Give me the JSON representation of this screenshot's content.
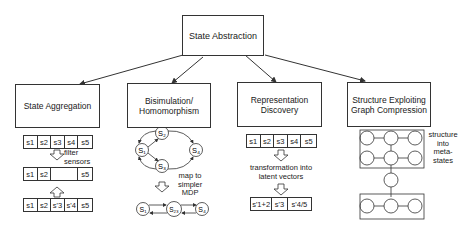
{
  "root": {
    "label": "State Abstraction"
  },
  "categories": [
    {
      "label": "State Aggregation"
    },
    {
      "label": "Bisimulation/\nHomomorphism"
    },
    {
      "label": "Representation\nDiscovery"
    },
    {
      "label": "Structure Exploiting\nGraph Compression"
    }
  ],
  "aggregation": {
    "row1": [
      "s1",
      "s2",
      "s3",
      "s4",
      "s5"
    ],
    "row2": [
      "s1",
      "s2",
      "",
      "s5"
    ],
    "row3": [
      "s1",
      "s2",
      "s'3",
      "s'4",
      "s5"
    ],
    "filter_label": "filter\nsensors"
  },
  "bisimulation": {
    "nodes_top": [
      "S1",
      "S2",
      "S3",
      "S4"
    ],
    "nodes_bottom": [
      "S1",
      "S23",
      "S4"
    ],
    "map_label": "map to\nsimpler\nMDP"
  },
  "representation": {
    "row1": [
      "s1",
      "s2",
      "s3",
      "s4",
      "s5"
    ],
    "row2": [
      "s'1+2",
      "s'3",
      "s'4/5"
    ],
    "transform_label": "transformation into\nlatent vectors"
  },
  "graph_compression": {
    "label": "structure\ninto\nmeta-\nstates"
  }
}
